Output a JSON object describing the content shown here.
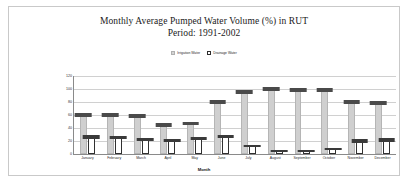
{
  "chart_data": {
    "type": "bar",
    "title": "Monthly Average Pumped Water Volume (%) in RUT",
    "subtitle": "Period: 1991-2002",
    "xlabel": "Month",
    "ylabel": "Pumped Water Volume (%)",
    "ylim": [
      0,
      120
    ],
    "yticks": [
      0,
      20,
      40,
      60,
      80,
      100,
      120
    ],
    "ytick_labels": [
      "0",
      "20",
      "40",
      "60",
      "80",
      "100",
      "120"
    ],
    "grid": true,
    "legend_position": "top-center",
    "categories": [
      "January",
      "February",
      "March",
      "April",
      "May",
      "June",
      "July",
      "August",
      "September",
      "October",
      "November",
      "December"
    ],
    "series": [
      {
        "name": "Irrigation Water",
        "color": "#cfcfcf",
        "values": [
          60,
          60,
          58,
          44,
          47,
          80,
          95,
          100,
          98,
          98,
          80,
          78
        ],
        "errors": [
          6,
          6,
          6,
          5,
          5,
          6,
          6,
          5,
          5,
          5,
          6,
          6
        ]
      },
      {
        "name": "Drainage Water",
        "color": "#ffffff",
        "values": [
          26,
          25,
          22,
          20,
          23,
          27,
          12,
          4,
          5,
          8,
          20,
          21
        ],
        "errors": [
          5,
          5,
          5,
          4,
          4,
          5,
          3,
          2,
          2,
          3,
          5,
          5
        ]
      }
    ]
  },
  "legend": {
    "items": [
      {
        "label": "Irrigation Water",
        "swatch": "irrigation"
      },
      {
        "label": "Drainage Water",
        "swatch": "drainage"
      }
    ]
  }
}
